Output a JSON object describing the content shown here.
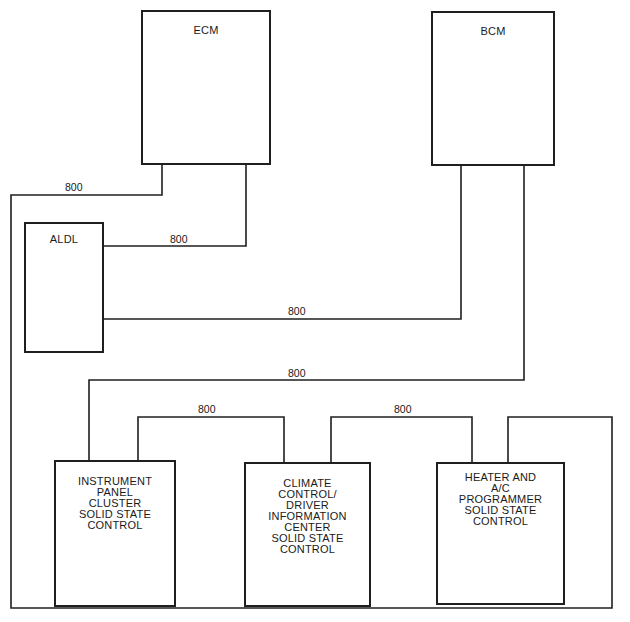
{
  "diagram": {
    "modules": [
      {
        "id": "ecm",
        "label": "ECM"
      },
      {
        "id": "bcm",
        "label": "BCM"
      },
      {
        "id": "aldl",
        "label": "ALDL"
      },
      {
        "id": "ipc",
        "label": "INSTRUMENT\nPANEL\nCLUSTER\nSOLID STATE\nCONTROL"
      },
      {
        "id": "ccdic",
        "label": "CLIMATE\nCONTROL/\nDRIVER\nINFORMATION\nCENTER\nSOLID STATE\nCONTROL"
      },
      {
        "id": "hac",
        "label": "HEATER AND\nA/C\nPROGRAMMER\nSOLID STATE\nCONTROL"
      }
    ],
    "wire_labels": [
      {
        "id": "ecm-outer-loop",
        "label": "800"
      },
      {
        "id": "ecm-aldl",
        "label": "800"
      },
      {
        "id": "bcm-aldl",
        "label": "800"
      },
      {
        "id": "bcm-ipc",
        "label": "800"
      },
      {
        "id": "ipc-ccdic",
        "label": "800"
      },
      {
        "id": "ccdic-hac",
        "label": "800"
      }
    ],
    "line_color": "#1f1f1f"
  }
}
